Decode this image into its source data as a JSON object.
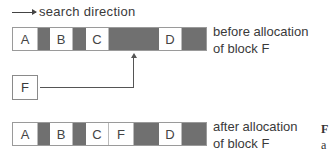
{
  "legend": {
    "direction_label": "search direction"
  },
  "before": {
    "label_line1": "before allocation",
    "label_line2": "of block F",
    "segments": [
      {
        "name": "A",
        "type": "used",
        "width": 25
      },
      {
        "name": "",
        "type": "free",
        "width": 12
      },
      {
        "name": "B",
        "type": "used",
        "width": 23
      },
      {
        "name": "",
        "type": "free",
        "width": 13
      },
      {
        "name": "C",
        "type": "used",
        "width": 23
      },
      {
        "name": "",
        "type": "free",
        "width": 50
      },
      {
        "name": "D",
        "type": "used",
        "width": 23
      },
      {
        "name": "",
        "type": "free",
        "width": 24
      }
    ]
  },
  "new_block": {
    "name": "F"
  },
  "after": {
    "label_line1": "after allocation",
    "label_line2": "of block F",
    "segments": [
      {
        "name": "A",
        "type": "used",
        "width": 25
      },
      {
        "name": "",
        "type": "free",
        "width": 12
      },
      {
        "name": "B",
        "type": "used",
        "width": 23
      },
      {
        "name": "",
        "type": "free",
        "width": 13
      },
      {
        "name": "C",
        "type": "used",
        "width": 23
      },
      {
        "name": "F",
        "type": "used",
        "width": 25
      },
      {
        "name": "",
        "type": "free",
        "width": 25
      },
      {
        "name": "D",
        "type": "used",
        "width": 23
      },
      {
        "name": "",
        "type": "free",
        "width": 24
      }
    ]
  },
  "caption": {
    "line1": "F",
    "line2": "a"
  },
  "colors": {
    "free_block": "#707070",
    "used_block": "#ffffff",
    "border": "#9a9a9a"
  }
}
